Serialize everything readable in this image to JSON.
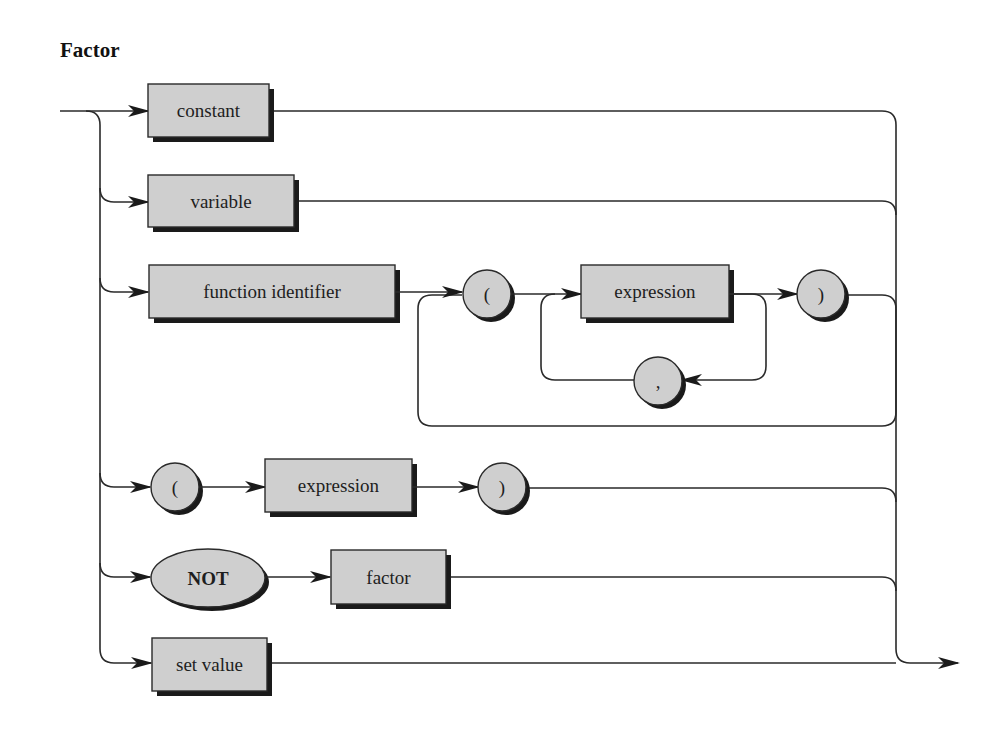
{
  "title": "Factor",
  "nodes": {
    "constant": "constant",
    "variable": "variable",
    "function_identifier": "function identifier",
    "fn_open_paren": "(",
    "fn_expression": "expression",
    "fn_close_paren": ")",
    "fn_comma": ",",
    "paren_open": "(",
    "paren_expression": "expression",
    "paren_close": ")",
    "not": "NOT",
    "factor": "factor",
    "set_value": "set value"
  },
  "colors": {
    "box_fill": "#cfcfcf",
    "stroke": "#2a2a2a",
    "shadow": "#1a1a1a"
  }
}
